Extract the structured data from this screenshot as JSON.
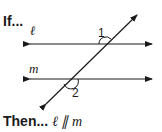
{
  "header": {
    "if_label": "If..."
  },
  "footer": {
    "then_label": "Then...",
    "conclusion": "ℓ ∥ m"
  },
  "diagram": {
    "line_l_label": "ℓ",
    "line_m_label": "m",
    "angle1_label": "1",
    "angle2_label": "2",
    "stroke_color": "#1a1a1a"
  }
}
